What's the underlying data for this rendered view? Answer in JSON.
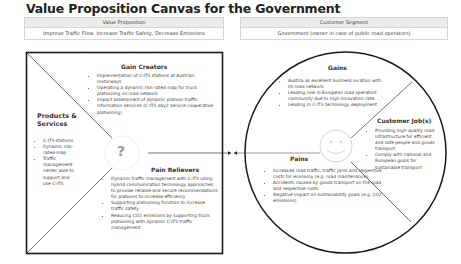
{
  "title": "Value Proposition Canvas for the Government",
  "value_proposition": {
    "header": "Value Proposition",
    "value": "Improve Traffic Flow, Increase Traffic Safety, Decrease Emissions"
  },
  "customer_segment": {
    "header": "Customer Segment",
    "value": "Government (owner in case of public road operators)"
  },
  "square": {
    "gain_creators": {
      "heading": "Gain Creators",
      "items": [
        "Implementation of C-ITS stations at Austrian motorways",
        "Operating a dynamic risk-rated map for truck platooning on road network",
        "Impact assessment of dynamic platoon traffic information services (C-ITS day2 service cooperative platooning)"
      ]
    },
    "products_services": {
      "heading": "Products & Services",
      "items": [
        "C-ITS stations",
        "Dynamic risk-rated-map",
        "Traffic management center able to support and use C-ITS"
      ]
    },
    "pain_relievers": {
      "heading": "Pain Relievers",
      "items": [
        "Dynamic traffic management with C-ITS using hybrid communication technology approaches to provide reliable and secure recommendations for platoons to increase efficiency",
        "Supporting platooning function to increase traffic safety",
        "Reducing CO2 emissions by supporting truck platooning with dynamic C-ITS traffic management"
      ]
    },
    "center_icon": "question-mark-icon",
    "center_symbol": "?"
  },
  "circle": {
    "gains": {
      "heading": "Gains",
      "items": [
        "Austria as excellent business location with its road network",
        "Leading role in European road operators' community due to high innovation rate",
        "Leading in C-ITS technology deployment"
      ]
    },
    "customer_jobs": {
      "heading": "Customer Job(s)",
      "items": [
        "Providing high-quality road infrastructure for efficient and safe people and goods transport",
        "Comply with national and European goals for sustainable transport"
      ]
    },
    "pains": {
      "heading": "Pains",
      "items": [
        "Increased road traffic, traffic jams and respective costs for economy (e.g. road maintenance)",
        "Accidents caused by goods transport on the road and respective costs",
        "Negative impact on sustainability goals (e.g. CO2 emissions)"
      ]
    },
    "center_icon": "smiley-face-icon"
  },
  "colors": {
    "stroke": "#1a1a1a",
    "header_fill": "#ececec",
    "text": "#444444",
    "icon_gray": "#c8c8c8"
  }
}
